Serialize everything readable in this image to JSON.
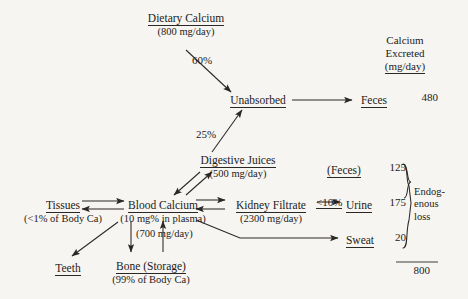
{
  "diagram": {
    "background_color": "#f7f5f1",
    "ink_color": "#1d1b19"
  },
  "header": {
    "excreted_line1": "Calcium",
    "excreted_line2": "Excreted",
    "excreted_line3": "(mg/day)"
  },
  "nodes": {
    "dietary_calcium": {
      "label": "Dietary Calcium",
      "sub": "(800 mg/day)"
    },
    "unabsorbed": {
      "label": "Unabsorbed",
      "sub": ""
    },
    "digestive_juices": {
      "label": "Digestive Juices",
      "sub": "(500 mg/day)"
    },
    "tissues": {
      "label": "Tissues",
      "sub": "(<1% of Body Ca)"
    },
    "blood_calcium": {
      "label": "Blood Calcium",
      "sub": "(10 mg% in plasma)"
    },
    "kidney_filtrate": {
      "label": "Kidney Filtrate",
      "sub": "(2300 mg/day)"
    },
    "teeth": {
      "label": "Teeth",
      "sub": ""
    },
    "bone": {
      "label": "Bone (Storage)",
      "sub": "(99% of Body Ca)"
    },
    "feces_out": {
      "label": "Feces"
    },
    "feces_endog": {
      "label": "(Feces)"
    },
    "urine": {
      "label": "Urine"
    },
    "sweat": {
      "label": "Sweat"
    }
  },
  "percentages": {
    "absorbed_to_unabsorbed": "60%",
    "digestive_to_unabsorbed": "25%",
    "kidney_to_urine": "<10%",
    "bone_exchange": "(700 mg/day)"
  },
  "values": {
    "feces": "480",
    "feces_endogenous": "125",
    "urine": "175",
    "sweat": "20",
    "total": "800"
  },
  "brace_label": {
    "line1": "Endog-",
    "line2": "enous",
    "line3": "loss"
  }
}
